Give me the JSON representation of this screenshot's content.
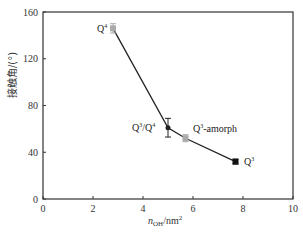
{
  "chart_data": {
    "type": "line",
    "title": "",
    "xlabel": "n_OH/nm^2",
    "ylabel": "接触角/(°)",
    "xlim": [
      0,
      10
    ],
    "ylim": [
      0,
      160
    ],
    "x_ticks": [
      "0",
      "2",
      "4",
      "6",
      "8",
      "10"
    ],
    "y_ticks": [
      "0",
      "40",
      "80",
      "120",
      "160"
    ],
    "grid": false,
    "legend": null,
    "series": [
      {
        "name": "contact angle",
        "points": [
          {
            "label": "Q4",
            "x": 2.8,
            "y": 146,
            "err": 4,
            "marker": "square",
            "color": "#aaaaaa"
          },
          {
            "label": "Q3/Q4",
            "x": 5.0,
            "y": 61,
            "err": 8,
            "marker": "circle",
            "color": "#222222"
          },
          {
            "label": "Q3-amorph",
            "x": 5.7,
            "y": 52,
            "err": 3,
            "marker": "square",
            "color": "#aaaaaa"
          },
          {
            "label": "Q3",
            "x": 7.7,
            "y": 32,
            "err": 2,
            "marker": "square",
            "color": "#111111"
          }
        ]
      }
    ]
  },
  "axes": {
    "ylabel_text": "接触角/(°)",
    "xlabel_main": "n",
    "xlabel_sub": "OH",
    "xlabel_unit": "/nm",
    "xlabel_sup": "2"
  },
  "labels": {
    "q4_base": "Q",
    "q4_sup": "4",
    "q34_base": "Q",
    "q34_sup1": "3",
    "q34_mid": "/Q",
    "q34_sup2": "4",
    "q3a_base": "Q",
    "q3a_sup": "3",
    "q3a_rest": "-amorph",
    "q3_base": "Q",
    "q3_sup": "3"
  }
}
